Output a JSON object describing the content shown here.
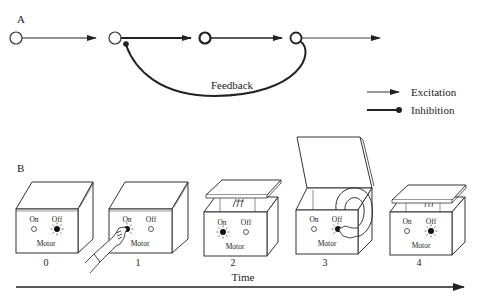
{
  "panel_a": {
    "label": "A",
    "feedback_label": "Feedback",
    "legend": {
      "excitation": "Excitation",
      "inhibition": "Inhibition"
    }
  },
  "panel_b": {
    "label": "B",
    "boxes": [
      {
        "index": "0",
        "on": "On",
        "off": "Off",
        "motor": "Motor",
        "lit": "off",
        "state": "closed"
      },
      {
        "index": "1",
        "on": "On",
        "off": "Off",
        "motor": "Motor",
        "lit": "on",
        "state": "closed-hand-pressing-on"
      },
      {
        "index": "2",
        "on": "On",
        "off": "Off",
        "motor": "Motor",
        "lit": "on",
        "state": "lid-lifting"
      },
      {
        "index": "3",
        "on": "On",
        "off": "Off",
        "motor": "Motor",
        "lit": "off",
        "state": "open-arm-pressing-off"
      },
      {
        "index": "4",
        "on": "On",
        "off": "Off",
        "motor": "Motor",
        "lit": "off",
        "state": "lid-closing"
      }
    ],
    "time_label": "Time"
  },
  "colors": {
    "ink": "#222222",
    "background": "#ffffff"
  }
}
